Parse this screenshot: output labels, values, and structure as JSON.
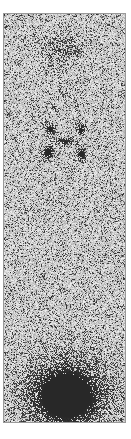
{
  "image": {
    "kind": "grayscale scintigraphy scan",
    "background": "#ffffff",
    "frame": {
      "x": 3,
      "y": 13,
      "width": 123,
      "height": 410,
      "border": "#9a9a9a"
    },
    "noise": {
      "base_gray": 205,
      "amplitude": 70,
      "seed": 7
    },
    "hotspots": [
      {
        "name": "head-region",
        "cx": 58,
        "cy": 35,
        "rx": 20,
        "ry": 18,
        "intensity": 0.35
      },
      {
        "name": "neck-faint",
        "cx": 60,
        "cy": 78,
        "rx": 10,
        "ry": 10,
        "intensity": 0.22
      },
      {
        "name": "upper-left-focus",
        "cx": 46,
        "cy": 115,
        "rx": 5,
        "ry": 6,
        "intensity": 0.9
      },
      {
        "name": "upper-right-focus",
        "cx": 77,
        "cy": 115,
        "rx": 5,
        "ry": 6,
        "intensity": 0.85
      },
      {
        "name": "upper-left-small",
        "cx": 50,
        "cy": 93,
        "rx": 2,
        "ry": 3,
        "intensity": 0.7
      },
      {
        "name": "upper-right-small",
        "cx": 72,
        "cy": 92,
        "rx": 2,
        "ry": 3,
        "intensity": 0.6
      },
      {
        "name": "center-band",
        "cx": 61,
        "cy": 127,
        "rx": 12,
        "ry": 4,
        "intensity": 0.7
      },
      {
        "name": "lower-left-focus",
        "cx": 44,
        "cy": 138,
        "rx": 6,
        "ry": 7,
        "intensity": 0.95
      },
      {
        "name": "lower-right-focus",
        "cx": 77,
        "cy": 140,
        "rx": 5,
        "ry": 7,
        "intensity": 0.9
      },
      {
        "name": "bladder",
        "cx": 62,
        "cy": 382,
        "rx": 34,
        "ry": 30,
        "intensity": 1.0
      },
      {
        "name": "bladder-halo",
        "cx": 62,
        "cy": 378,
        "rx": 48,
        "ry": 44,
        "intensity": 0.35
      }
    ]
  }
}
